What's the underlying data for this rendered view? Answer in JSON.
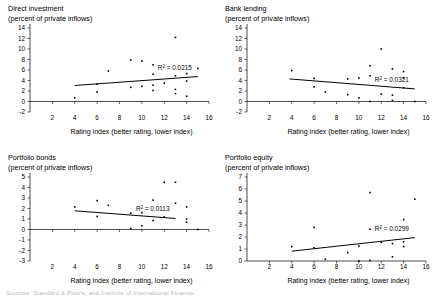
{
  "figure": {
    "width": 434,
    "height": 297,
    "background": "#ffffff",
    "ink_color": "#000000",
    "footer_fragment": "Sources: Standard & Poor's; and Institute of International Finance."
  },
  "chart_data": [
    {
      "type": "scatter",
      "title": "Direct investment",
      "subtitle": "(percent of private inflows)",
      "xlabel": "Rating index (better rating, lower index)",
      "ylabel": "",
      "xlim": [
        0,
        16
      ],
      "ylim": [
        -2,
        14
      ],
      "xticks": [
        2,
        4,
        6,
        8,
        10,
        12,
        14,
        16
      ],
      "yticks": [
        -2,
        0,
        2,
        4,
        6,
        8,
        10,
        12,
        14
      ],
      "grid": false,
      "legend": "none",
      "annotation": "R2 = 0.0215",
      "r_squared": 0.0215,
      "trend": {
        "x0": 4.0,
        "y0": 3.05,
        "x1": 15.0,
        "y1": 4.75
      },
      "x": [
        4,
        6,
        6,
        7,
        9,
        9,
        10,
        10,
        11,
        11,
        11,
        11,
        12,
        13,
        13,
        13,
        13,
        14,
        14,
        14,
        15
      ],
      "y": [
        0.7,
        3.3,
        1.8,
        5.8,
        7.9,
        2.7,
        7.7,
        2.9,
        7.0,
        5.2,
        3.1,
        2.1,
        3.5,
        12.2,
        4.9,
        2.3,
        1.5,
        5.3,
        3.9,
        1.0,
        6.3
      ]
    },
    {
      "type": "scatter",
      "title": "Bank lending",
      "subtitle": "(percent of private inflows)",
      "xlabel": "Rating index (better rating, lower index)",
      "ylabel": "",
      "xlim": [
        0,
        16
      ],
      "ylim": [
        -2,
        14
      ],
      "xticks": [
        2,
        4,
        6,
        8,
        10,
        12,
        14,
        16
      ],
      "yticks": [
        -2,
        0,
        2,
        4,
        6,
        8,
        10,
        12,
        14
      ],
      "grid": false,
      "legend": "none",
      "annotation": "R2 = 0.0321",
      "r_squared": 0.0321,
      "trend": {
        "x0": 3.8,
        "y0": 4.3,
        "x1": 15.0,
        "y1": 2.4
      },
      "x": [
        4,
        6,
        6,
        7,
        9,
        9,
        10,
        10,
        11,
        11,
        11,
        12,
        12,
        13,
        13,
        13,
        14,
        14,
        14,
        15
      ],
      "y": [
        5.9,
        4.4,
        2.8,
        1.8,
        4.3,
        1.3,
        4.5,
        0.7,
        6.8,
        4.9,
        0.0,
        10.0,
        1.4,
        6.2,
        1.2,
        0.2,
        5.7,
        4.5,
        2.6,
        0.0
      ]
    },
    {
      "type": "scatter",
      "title": "Portfolio bonds",
      "subtitle": "(percent of private inflows)",
      "xlabel": "Rating index (better rating, lower index)",
      "ylabel": "",
      "xlim": [
        0,
        16
      ],
      "ylim": [
        -3,
        5
      ],
      "xticks": [
        2,
        4,
        6,
        8,
        10,
        12,
        14,
        16
      ],
      "yticks": [
        -3,
        -2,
        -1,
        0,
        1,
        2,
        3,
        4,
        5
      ],
      "grid": false,
      "legend": "none",
      "annotation": "R2 = 0.0113",
      "r_squared": 0.0113,
      "trend": {
        "x0": 4.0,
        "y0": 1.78,
        "x1": 13.0,
        "y1": 1.05
      },
      "x": [
        4,
        6,
        6,
        7,
        9,
        9,
        10,
        10,
        11,
        11,
        12,
        12,
        13,
        13,
        14,
        14,
        14,
        15
      ],
      "y": [
        2.15,
        2.75,
        1.25,
        2.3,
        1.55,
        0.1,
        1.6,
        0.35,
        2.8,
        0.85,
        4.5,
        1.2,
        4.5,
        2.5,
        2.15,
        1.0,
        0.7,
        0.0
      ]
    },
    {
      "type": "scatter",
      "title": "Portfolio equity",
      "subtitle": "(percent of private inflows)",
      "xlabel": "Rating index (better rating, lower index)",
      "ylabel": "",
      "xlim": [
        0,
        16
      ],
      "ylim": [
        0,
        7
      ],
      "xticks": [
        2,
        4,
        6,
        8,
        10,
        12,
        14,
        16
      ],
      "yticks": [
        0,
        1,
        2,
        3,
        4,
        5,
        6,
        7
      ],
      "grid": false,
      "legend": "none",
      "annotation": "R2 = 0.0299",
      "r_squared": 0.0299,
      "trend": {
        "x0": 4.0,
        "y0": 0.82,
        "x1": 15.0,
        "y1": 1.95
      },
      "x": [
        4,
        6,
        6,
        7,
        9,
        10,
        10,
        11,
        11,
        11,
        12,
        13,
        13,
        14,
        14,
        14,
        15
      ],
      "y": [
        1.2,
        2.8,
        1.1,
        0.15,
        0.7,
        1.25,
        0.0,
        5.7,
        2.65,
        0.05,
        1.55,
        1.45,
        0.35,
        3.45,
        1.6,
        1.2,
        5.15
      ]
    }
  ]
}
